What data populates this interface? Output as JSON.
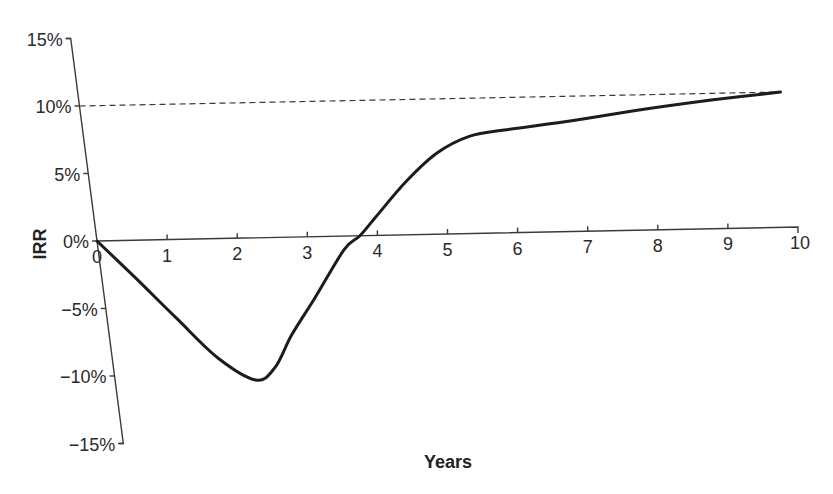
{
  "chart_data": {
    "type": "line",
    "title": "",
    "xlabel": "Years",
    "ylabel": "IRR",
    "x_ticks": [
      "0",
      "1",
      "2",
      "3",
      "4",
      "5",
      "6",
      "7",
      "8",
      "9",
      "10"
    ],
    "y_ticks": [
      "15%",
      "10%",
      "5%",
      "0%",
      "−5%",
      "−10%",
      "−15%"
    ],
    "xlim": [
      0,
      10
    ],
    "ylim": [
      -15,
      15
    ],
    "grid": false,
    "legend": null,
    "series": [
      {
        "name": "IRR",
        "style": "solid",
        "x": [
          0,
          0.5,
          1,
          1.5,
          2,
          2.3,
          2.6,
          3,
          3.5,
          3.75,
          4,
          4.5,
          5,
          5.5,
          6,
          7,
          8,
          9,
          10
        ],
        "values": [
          0,
          -2.9,
          -5.9,
          -8.8,
          -10.5,
          -9.6,
          -7.2,
          -4.5,
          -1.0,
          0,
          1.3,
          3.9,
          6.0,
          7.2,
          7.6,
          8.2,
          8.9,
          9.5,
          10.0
        ]
      },
      {
        "name": "Reference rate",
        "style": "dashed",
        "x": [
          0,
          10
        ],
        "values": [
          10,
          10
        ]
      }
    ]
  },
  "labels": {
    "x_axis_title": "Years",
    "y_axis_title": "IRR"
  }
}
